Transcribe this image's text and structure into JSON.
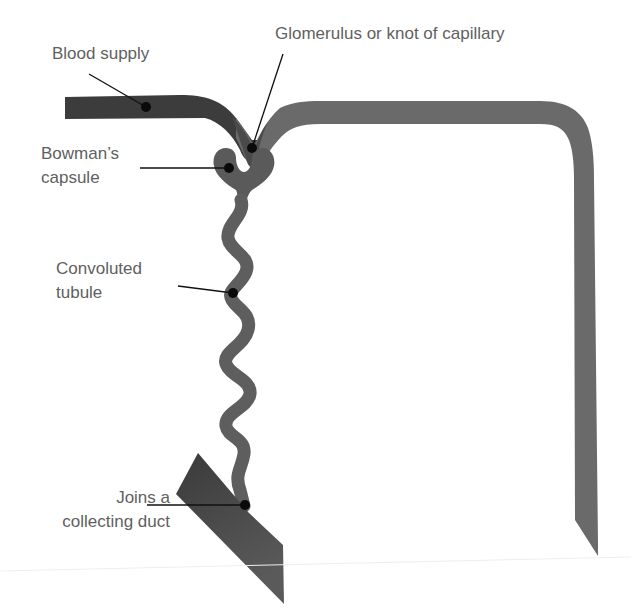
{
  "colors": {
    "background": "#ffffff",
    "label_text": "#5f5f5f",
    "blood_vessel_dark": "#3c3c3c",
    "blood_vessel_light": "#6e6e6e",
    "capsule": "#5a5a5a",
    "tubule": "#5e5e5e",
    "collecting_duct": "#444444",
    "leader_line": "#111111",
    "leader_dot": "#0a0a0a"
  },
  "labels": {
    "blood_supply": {
      "text": "Blood supply",
      "lines": [
        "Blood supply"
      ]
    },
    "glomerulus": {
      "text": "Glomerulus or knot of capillary",
      "lines": [
        "Glomerulus or knot of capillary"
      ]
    },
    "bowmans_capsule": {
      "text": "Bowman’s capsule",
      "lines": [
        "Bowman’s",
        "capsule"
      ]
    },
    "convoluted_tubule": {
      "text": "Convoluted tubule",
      "lines": [
        "Convoluted",
        "tubule"
      ]
    },
    "collecting_duct": {
      "text": "Joins a collecting duct",
      "lines": [
        "Joins a",
        "collecting duct"
      ]
    }
  },
  "parts": [
    {
      "id": "blood-supply",
      "name": "Blood supply"
    },
    {
      "id": "glomerulus",
      "name": "Glomerulus or knot of capillary"
    },
    {
      "id": "bowmans-capsule",
      "name": "Bowman’s capsule"
    },
    {
      "id": "convoluted-tubule",
      "name": "Convoluted tubule"
    },
    {
      "id": "collecting-duct",
      "name": "Joins a collecting duct"
    }
  ]
}
